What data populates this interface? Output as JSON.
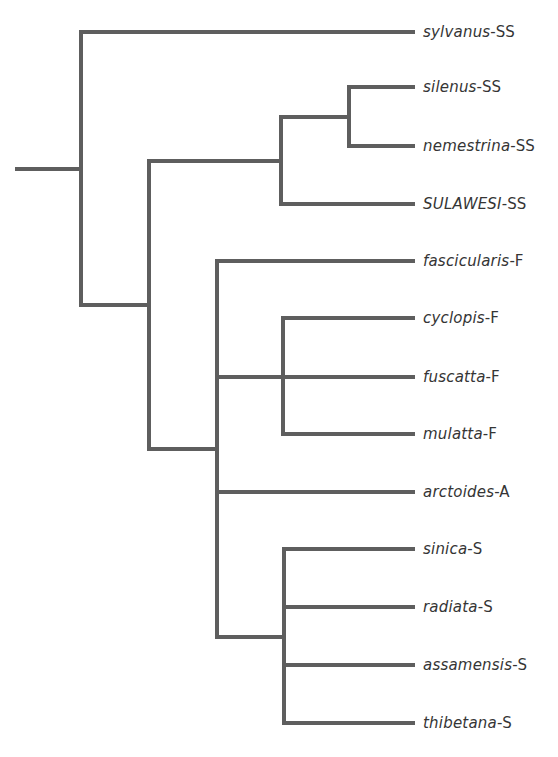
{
  "diagram": {
    "type": "phylogenetic-tree",
    "line_color": "#5e5e5e",
    "text_color": "#353535",
    "leaves": [
      {
        "species": "sylvanus",
        "group": "-SS",
        "y": 32
      },
      {
        "species": "silenus",
        "group": "-SS",
        "y": 87
      },
      {
        "species": "nemestrina",
        "group": "-SS",
        "y": 146
      },
      {
        "species": "SULAWESI",
        "group": "-SS",
        "y": 204
      },
      {
        "species": "fascicularis",
        "group": "-F",
        "y": 261
      },
      {
        "species": "cyclopis",
        "group": "-F",
        "y": 318
      },
      {
        "species": "fuscatta",
        "group": "-F",
        "y": 377
      },
      {
        "species": "mulatta",
        "group": "-F",
        "y": 434
      },
      {
        "species": "arctoides",
        "group": "-A",
        "y": 492
      },
      {
        "species": "sinica",
        "group": "-S",
        "y": 549
      },
      {
        "species": "radiata",
        "group": "-S",
        "y": 607
      },
      {
        "species": "assamensis",
        "group": "-S",
        "y": 665
      },
      {
        "species": "thibetana",
        "group": "-S",
        "y": 723
      }
    ],
    "newick": "(sylvanus-SS,((silenus-SS,nemestrina-SS),SULAWESI-SS),(fascicularis-F,((cyclopis-F,mulatta-F),fuscatta-F),arctoides-A,(sinica-S,radiata-S,assamensis-S,thibetana-S)))"
  }
}
